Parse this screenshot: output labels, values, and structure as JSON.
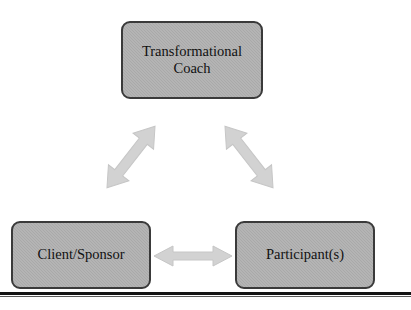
{
  "diagram": {
    "type": "relationship-triad",
    "background_color": "#ffffff",
    "node_fill_color": "#a9a9a9",
    "node_border_color": "#3a3a3a",
    "arrow_color": "#d2d2d2",
    "arrow_stroke_color": "#c2c2c2",
    "rule_color": "#141414",
    "nodes": [
      {
        "id": "coach",
        "label": "Transformational\nCoach",
        "position": "top-center"
      },
      {
        "id": "client",
        "label": "Client/Sponsor",
        "position": "bottom-left"
      },
      {
        "id": "participant",
        "label": "Participant(s)",
        "position": "bottom-right"
      }
    ],
    "connectors": [
      {
        "id": "coach-client",
        "from": "coach",
        "to": "client",
        "style": "double-headed",
        "orientation": "diagonal-down-left"
      },
      {
        "id": "coach-participant",
        "from": "coach",
        "to": "participant",
        "style": "double-headed",
        "orientation": "diagonal-down-right"
      },
      {
        "id": "client-participant",
        "from": "client",
        "to": "participant",
        "style": "double-headed",
        "orientation": "horizontal"
      }
    ]
  }
}
